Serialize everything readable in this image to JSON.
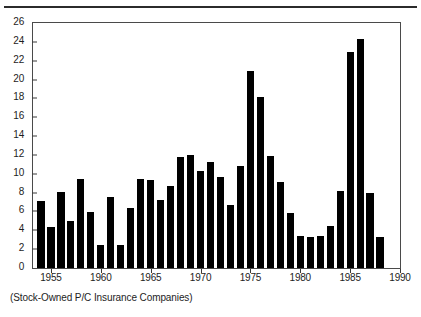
{
  "caption": "(Stock-Owned P/C Insurance Companies)",
  "colors": {
    "bar": "#000000",
    "axis": "#4a4a4a",
    "text": "#1d1d1d",
    "rule": "#2b2b2b"
  },
  "chart_data": {
    "type": "bar",
    "title": "",
    "subtitle": "",
    "xlabel": "",
    "ylabel": "",
    "grid": false,
    "legend": "none",
    "xlim": [
      1953.2,
      1990.0
    ],
    "ylim": [
      0,
      26
    ],
    "ytick_labels": [
      "0",
      "2",
      "4",
      "6",
      "8",
      "10",
      "12",
      "14",
      "16",
      "18",
      "20",
      "22",
      "24",
      "26"
    ],
    "ytick_values": [
      0,
      2,
      4,
      6,
      8,
      10,
      12,
      14,
      16,
      18,
      20,
      22,
      24,
      26
    ],
    "xtick_labels": [
      "1955",
      "1960",
      "1965",
      "1970",
      "1975",
      "1980",
      "1985",
      "1990"
    ],
    "xtick_values": [
      1955,
      1960,
      1965,
      1970,
      1975,
      1980,
      1985,
      1990
    ],
    "categories": [
      1954,
      1955,
      1956,
      1957,
      1958,
      1959,
      1960,
      1961,
      1962,
      1963,
      1964,
      1965,
      1966,
      1967,
      1968,
      1969,
      1970,
      1971,
      1972,
      1973,
      1974,
      1975,
      1976,
      1977,
      1978,
      1979,
      1980,
      1981,
      1982,
      1983,
      1984,
      1985,
      1986,
      1987,
      1988
    ],
    "values": [
      7.1,
      4.3,
      8.1,
      5.0,
      9.4,
      5.9,
      2.4,
      7.5,
      2.4,
      6.4,
      9.4,
      9.3,
      7.2,
      8.7,
      11.8,
      12.0,
      10.3,
      11.3,
      9.7,
      6.7,
      10.8,
      20.9,
      18.2,
      11.9,
      9.1,
      5.8,
      3.4,
      3.3,
      3.4,
      4.5,
      8.2,
      22.9,
      24.3,
      8.0,
      3.3
    ]
  }
}
